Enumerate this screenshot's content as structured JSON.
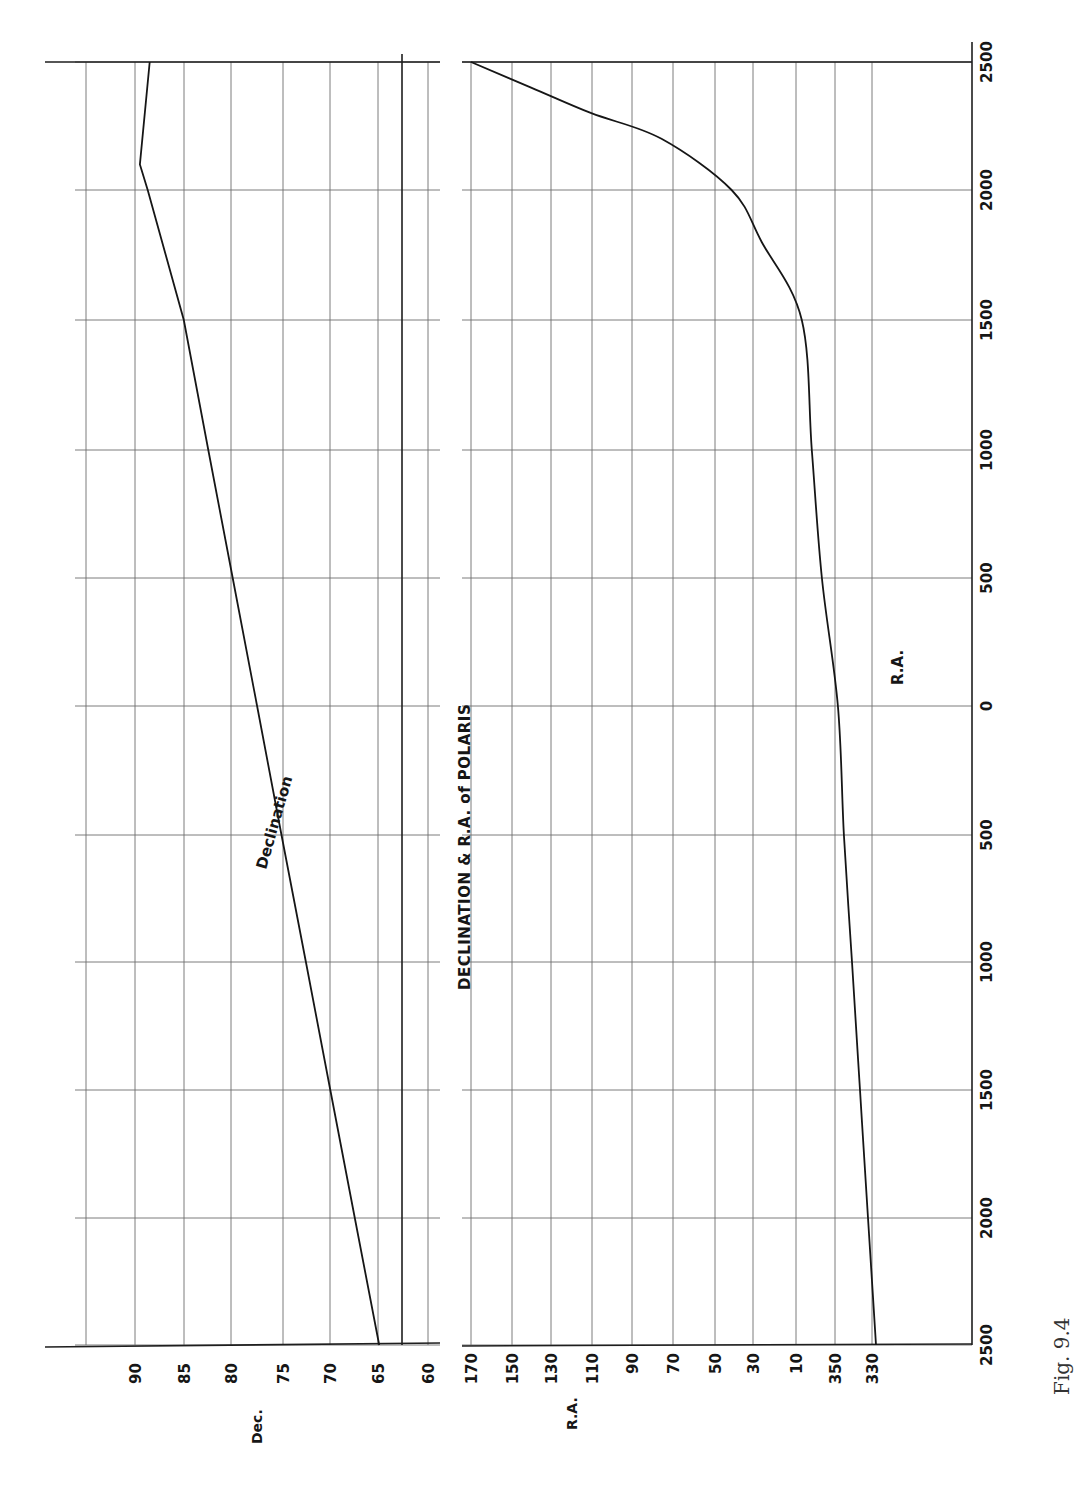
{
  "figure": {
    "caption": "Fig. 9.4",
    "title": "DECLINATION & R.A. of POLARIS"
  },
  "axes": {
    "year_axis": {
      "orientation": "vertical (right side, rotated page)",
      "tick_labels": [
        "2500",
        "2000",
        "1500",
        "1000",
        "500",
        "0",
        "500",
        "1000",
        "1500",
        "2000",
        "2500"
      ],
      "tick_values": [
        2500,
        2000,
        1500,
        1000,
        500,
        0,
        -500,
        -1000,
        -1500,
        -2000,
        -2500
      ],
      "tick_y": [
        62,
        190,
        320,
        450,
        578,
        706,
        835,
        962,
        1090,
        1218,
        1345
      ]
    },
    "dec_axis": {
      "label": "Dec.",
      "tick_labels": [
        "90",
        "85",
        "80",
        "75",
        "70",
        "65",
        "60"
      ],
      "tick_values": [
        90,
        85,
        80,
        75,
        70,
        65,
        60
      ],
      "tick_x": [
        135,
        184,
        231,
        283,
        330,
        378,
        428
      ],
      "extra_grid_x": [
        86
      ],
      "heavy_line_x": 402
    },
    "ra_axis": {
      "label": "R.A.",
      "tick_labels": [
        "170",
        "150",
        "130",
        "110",
        "90",
        "70",
        "50",
        "30",
        "10",
        "350",
        "330"
      ],
      "tick_values": [
        170,
        150,
        130,
        110,
        90,
        70,
        50,
        30,
        10,
        350,
        330
      ],
      "tick_x": [
        471,
        512,
        551,
        592,
        632,
        673,
        715,
        753,
        796,
        835,
        872
      ]
    }
  },
  "annotations": {
    "declination_label": "Declination",
    "ra_label": "R.A."
  },
  "chart_data": [
    {
      "type": "line",
      "title": "Declination of Polaris",
      "xlabel": "Year (BC below 0, AD above 0)",
      "ylabel": "Dec.",
      "x": [
        -2500,
        -2000,
        -1500,
        -1000,
        -500,
        0,
        500,
        1000,
        1500,
        2000,
        2100,
        2500
      ],
      "series": [
        {
          "name": "Declination",
          "values": [
            65.0,
            67.5,
            70.0,
            72.5,
            75.0,
            77.5,
            80.0,
            82.5,
            85.0,
            88.7,
            89.5,
            88.5
          ]
        }
      ],
      "ylim": [
        60,
        95
      ],
      "grid": true,
      "tick_labels": [
        "90",
        "85",
        "80",
        "75",
        "70",
        "65",
        "60"
      ]
    },
    {
      "type": "line",
      "title": "Right Ascension of Polaris",
      "xlabel": "Year (BC below 0, AD above 0)",
      "ylabel": "R.A.",
      "x": [
        -2500,
        -2000,
        -1500,
        -1000,
        -500,
        0,
        500,
        1000,
        1500,
        1800,
        2000,
        2200,
        2300,
        2400,
        2500
      ],
      "series": [
        {
          "name": "R.A.",
          "values": [
            328,
            332,
            336,
            340,
            344,
            347,
            355,
            0,
            5,
            25,
            40,
            75,
            110,
            140,
            170
          ]
        }
      ],
      "ylim_note": "R.A. axis wraps through 360/0: 330, 350, 10, 30 ... 170",
      "grid": true,
      "tick_labels": [
        "170",
        "150",
        "130",
        "110",
        "90",
        "70",
        "50",
        "30",
        "10",
        "350",
        "330"
      ]
    }
  ]
}
